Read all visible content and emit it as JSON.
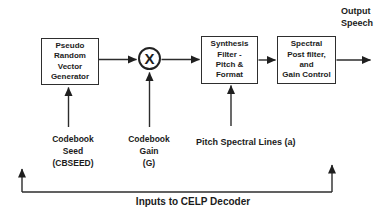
{
  "diagram": {
    "blocks": {
      "generator": {
        "label": "Pseudo\nRandom\nVector\nGenerator"
      },
      "multiplier": {
        "symbol": "X"
      },
      "synthesis": {
        "label": "Synthesis\nFilter -\nPitch &\nFormat"
      },
      "postfilter": {
        "label": "Spectral\nPost filter,\nand\nGain Control"
      }
    },
    "labels": {
      "output": "Output\nSpeech",
      "codebook_seed": "Codebook\nSeed\n(CBSEED)",
      "codebook_gain": "Codebook\nGain\n(G)",
      "pitch_spectral": "Pitch Spectral Lines (a)",
      "caption": "Inputs to CELP Decoder"
    },
    "colors": {
      "ink": "#1f1f1f",
      "background": "#ffffff"
    }
  }
}
